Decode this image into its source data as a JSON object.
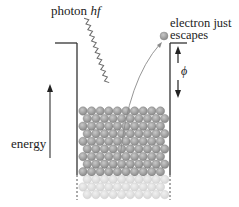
{
  "diagram": {
    "labels": {
      "photon": "photon ",
      "photon_symbol": "hf",
      "electron_line1": "electron just",
      "electron_line2": "escapes",
      "energy": "energy",
      "work_function": "ϕ"
    },
    "colors": {
      "line": "#333333",
      "atom": "#9a9a9a",
      "atom_faded": "#d8d8d8",
      "photon_wave": "#6a6a6a",
      "electron_path": "#8a8a8a"
    },
    "lattice": {
      "rows_dark": 9,
      "rows_faded": 3,
      "columns": 11
    }
  }
}
